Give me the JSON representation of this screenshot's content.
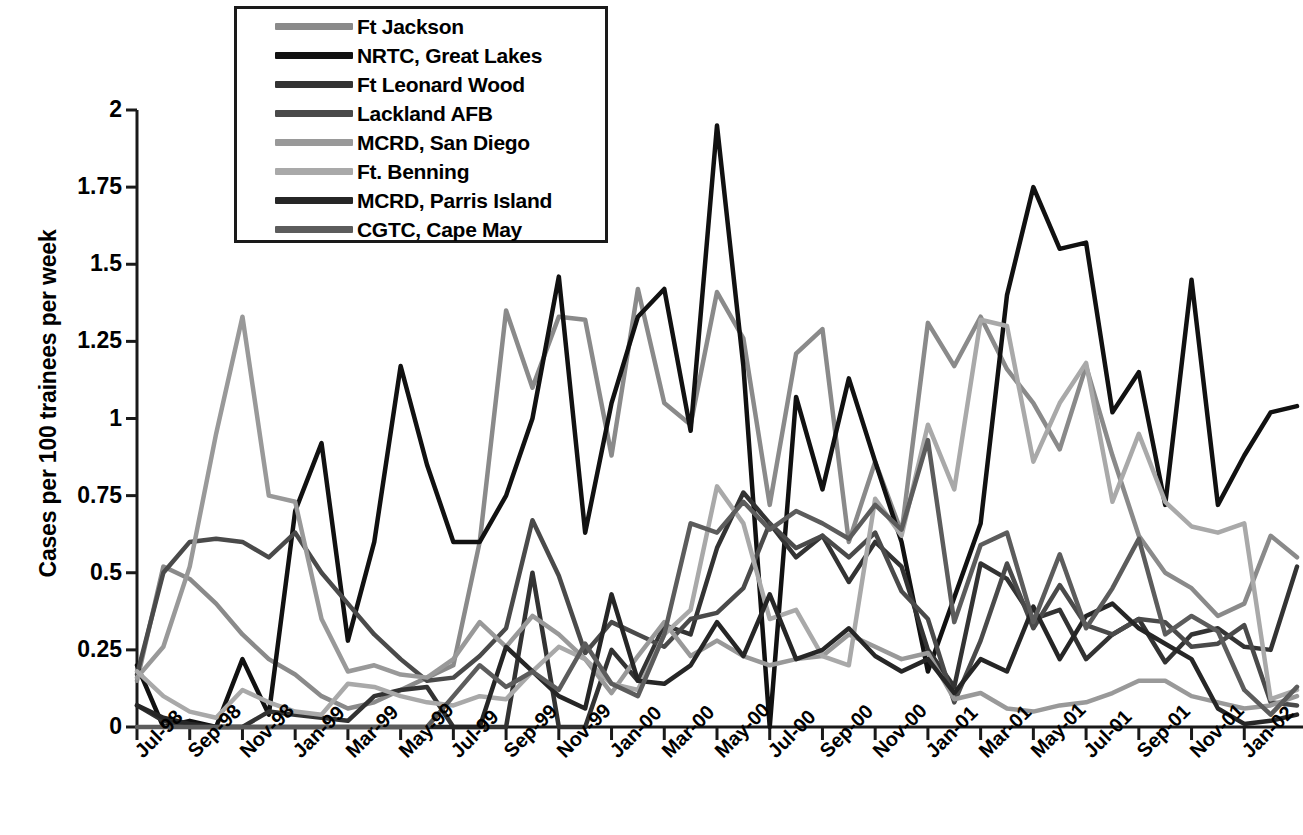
{
  "chart_data": {
    "type": "line",
    "title": "",
    "xlabel": "",
    "ylabel": "Cases per 100 trainees per week",
    "ylim": [
      0,
      2
    ],
    "ytick_labels": [
      "0",
      "0.25",
      "0.5",
      "0.75",
      "1",
      "1.25",
      "1.5",
      "1.75",
      "2"
    ],
    "ytick_values": [
      0,
      0.25,
      0.5,
      0.75,
      1,
      1.25,
      1.5,
      1.75,
      2
    ],
    "grid": false,
    "legend_position": "top-center-inside",
    "xtick_labels": [
      "Jul-98",
      "Sep-98",
      "Nov-98",
      "Jan-99",
      "Mar-99",
      "May-99",
      "Jul-99",
      "Sep-99",
      "Nov-99",
      "Jan-00",
      "Mar-00",
      "May-00",
      "Jul-00",
      "Sep-00",
      "Nov-00",
      "Jan-01",
      "Mar-01",
      "May-01",
      "Jul-01",
      "Sep-01",
      "Nov-01",
      "Jan-02"
    ],
    "x": [
      "Jul-98",
      "Aug-98",
      "Sep-98",
      "Oct-98",
      "Nov-98",
      "Dec-98",
      "Jan-99",
      "Feb-99",
      "Mar-99",
      "Apr-99",
      "May-99",
      "Jun-99",
      "Jul-99",
      "Aug-99",
      "Sep-99",
      "Oct-99",
      "Nov-99",
      "Dec-99",
      "Jan-00",
      "Feb-00",
      "Mar-00",
      "Apr-00",
      "May-00",
      "Jun-00",
      "Jul-00",
      "Aug-00",
      "Sep-00",
      "Oct-00",
      "Nov-00",
      "Dec-00",
      "Jan-01",
      "Feb-01",
      "Mar-01",
      "Apr-01",
      "May-01",
      "Jun-01",
      "Jul-01",
      "Aug-01",
      "Sep-01",
      "Oct-01",
      "Nov-01",
      "Dec-01",
      "Jan-02",
      "Feb-02",
      "Mar-02"
    ],
    "series": [
      {
        "name": "Ft Jackson",
        "color": "#8a8a8a",
        "values": [
          0.15,
          0.52,
          0.48,
          0.4,
          0.3,
          0.22,
          0.17,
          0.1,
          0.06,
          0.08,
          0.12,
          0.16,
          0.2,
          0.6,
          1.35,
          1.1,
          1.33,
          1.32,
          0.88,
          1.42,
          1.05,
          0.98,
          1.41,
          1.26,
          0.72,
          1.21,
          1.29,
          0.6,
          0.86,
          0.63,
          1.31,
          1.17,
          1.33,
          1.16,
          1.05,
          0.9,
          1.17,
          0.88,
          0.62,
          0.5,
          0.45,
          0.36,
          0.4,
          0.62,
          0.55
        ]
      },
      {
        "name": "NRTC, Great Lakes",
        "color": "#111111",
        "values": [
          0.2,
          0.0,
          0.02,
          0.0,
          0.22,
          0.04,
          0.7,
          0.92,
          0.28,
          0.6,
          1.17,
          0.85,
          0.6,
          0.6,
          0.75,
          1.0,
          1.46,
          0.63,
          1.05,
          1.33,
          1.42,
          0.96,
          1.95,
          1.17,
          0.0,
          1.07,
          0.77,
          1.13,
          0.86,
          0.6,
          0.18,
          0.42,
          0.66,
          1.4,
          1.75,
          1.55,
          1.57,
          1.02,
          1.15,
          0.72,
          1.45,
          0.72,
          0.88,
          1.02,
          1.04
        ]
      },
      {
        "name": "Ft Leonard Wood",
        "color": "#333333",
        "values": [
          0.07,
          0.02,
          0.0,
          0.0,
          0.0,
          0.05,
          0.04,
          0.03,
          0.02,
          0.1,
          0.12,
          0.13,
          0.0,
          0.0,
          0.0,
          0.5,
          0.0,
          0.0,
          0.25,
          0.15,
          0.33,
          0.3,
          0.58,
          0.76,
          0.66,
          0.55,
          0.62,
          0.47,
          0.6,
          0.52,
          0.25,
          0.13,
          0.53,
          0.48,
          0.35,
          0.38,
          0.22,
          0.3,
          0.35,
          0.21,
          0.3,
          0.32,
          0.26,
          0.25,
          0.52
        ]
      },
      {
        "name": "Lackland AFB",
        "color": "#4a4a4a",
        "values": [
          0.17,
          0.5,
          0.6,
          0.61,
          0.6,
          0.55,
          0.63,
          0.5,
          0.4,
          0.3,
          0.22,
          0.15,
          0.16,
          0.23,
          0.32,
          0.67,
          0.49,
          0.24,
          0.34,
          0.3,
          0.26,
          0.35,
          0.37,
          0.45,
          0.66,
          0.58,
          0.62,
          0.55,
          0.63,
          0.44,
          0.35,
          0.08,
          0.28,
          0.53,
          0.32,
          0.46,
          0.33,
          0.3,
          0.35,
          0.34,
          0.26,
          0.27,
          0.33,
          0.08,
          0.07
        ]
      },
      {
        "name": "MCRD, San Diego",
        "color": "#999999",
        "values": [
          0.16,
          0.26,
          0.52,
          0.95,
          1.33,
          0.75,
          0.73,
          0.35,
          0.18,
          0.2,
          0.17,
          0.16,
          0.22,
          0.34,
          0.26,
          0.36,
          0.3,
          0.22,
          0.11,
          0.23,
          0.34,
          0.23,
          0.28,
          0.23,
          0.2,
          0.22,
          0.23,
          0.3,
          0.26,
          0.22,
          0.24,
          0.09,
          0.11,
          0.06,
          0.05,
          0.07,
          0.08,
          0.11,
          0.15,
          0.15,
          0.1,
          0.08,
          0.06,
          0.07,
          0.1
        ]
      },
      {
        "name": "Ft. Benning",
        "color": "#a9a9a9",
        "values": [
          0.18,
          0.1,
          0.05,
          0.03,
          0.12,
          0.08,
          0.05,
          0.04,
          0.14,
          0.13,
          0.1,
          0.08,
          0.07,
          0.1,
          0.09,
          0.18,
          0.26,
          0.22,
          0.14,
          0.12,
          0.3,
          0.38,
          0.78,
          0.66,
          0.35,
          0.38,
          0.23,
          0.2,
          0.74,
          0.62,
          0.98,
          0.77,
          1.32,
          1.3,
          0.86,
          1.05,
          1.18,
          0.73,
          0.95,
          0.73,
          0.65,
          0.63,
          0.66,
          0.09,
          0.12
        ]
      },
      {
        "name": "MCRD, Parris Island",
        "color": "#262626",
        "values": [
          0.07,
          0.03,
          0.01,
          0.0,
          0.0,
          0.0,
          0.0,
          0.0,
          0.0,
          0.0,
          0.0,
          0.0,
          0.0,
          0.0,
          0.26,
          0.18,
          0.1,
          0.06,
          0.43,
          0.15,
          0.14,
          0.2,
          0.34,
          0.23,
          0.43,
          0.22,
          0.25,
          0.32,
          0.23,
          0.18,
          0.22,
          0.11,
          0.22,
          0.18,
          0.39,
          0.22,
          0.36,
          0.4,
          0.32,
          0.27,
          0.22,
          0.06,
          0.01,
          0.02,
          0.04
        ]
      },
      {
        "name": "CGTC, Cape May",
        "color": "#5c5c5c",
        "values": [
          0.0,
          0.0,
          0.0,
          0.0,
          0.0,
          0.0,
          0.0,
          0.0,
          0.0,
          0.0,
          0.0,
          0.0,
          0.1,
          0.2,
          0.13,
          0.18,
          0.12,
          0.27,
          0.14,
          0.1,
          0.3,
          0.66,
          0.63,
          0.73,
          0.64,
          0.7,
          0.66,
          0.61,
          0.72,
          0.64,
          0.93,
          0.34,
          0.59,
          0.63,
          0.34,
          0.56,
          0.32,
          0.45,
          0.61,
          0.3,
          0.36,
          0.31,
          0.12,
          0.04,
          0.13
        ]
      }
    ]
  },
  "legend": {
    "items": [
      {
        "label": "Ft Jackson"
      },
      {
        "label": "NRTC, Great Lakes"
      },
      {
        "label": "Ft Leonard Wood"
      },
      {
        "label": "Lackland AFB"
      },
      {
        "label": "MCRD, San Diego"
      },
      {
        "label": "Ft. Benning"
      },
      {
        "label": "MCRD, Parris Island"
      },
      {
        "label": "CGTC, Cape May"
      }
    ]
  },
  "axis": {
    "line_color": "#1a1a1a"
  }
}
